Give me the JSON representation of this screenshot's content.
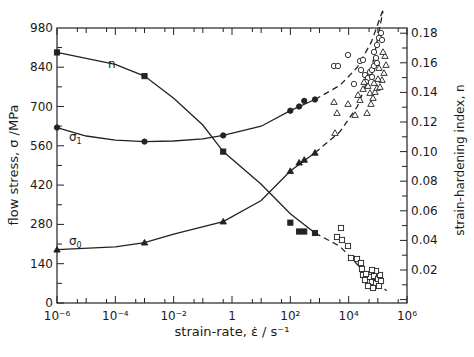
{
  "chart_data": {
    "type": "line",
    "title": "",
    "xlabel": "strain-rate, ε̇ /s⁻¹",
    "ylabel_left": "flow stress, σ /MPa",
    "ylabel_right": "strain-hardening index, n",
    "x_scale": "log",
    "xlim": [
      1e-06,
      1000000.0
    ],
    "ylim_left": [
      0,
      1050
    ],
    "ylim_right": [
      0,
      0.19
    ],
    "x_ticks": [
      "10⁻⁶",
      "10⁻⁴",
      "10⁻²",
      "1",
      "10²",
      "10⁴",
      "10⁶"
    ],
    "y_ticks_left": [
      0,
      140,
      280,
      420,
      560,
      700,
      840,
      980
    ],
    "y_ticks_right": [
      "0.02",
      "0.04",
      "0.06",
      "0.08",
      "0.10",
      "0.12",
      "0.14",
      "0.16",
      "0.18"
    ],
    "grid": false,
    "legend": "curve labels inline",
    "series": [
      {
        "name": "n",
        "axis": "right",
        "marker": "filled square / open square",
        "points": [
          [
            1e-06,
            0.167
          ],
          [
            0.001,
            0.151
          ],
          [
            0.5,
            0.1
          ],
          [
            100,
            0.052
          ],
          [
            200,
            0.046
          ],
          [
            300,
            0.046
          ],
          [
            700,
            0.045
          ]
        ],
        "open_points_approx": [
          [
            5000,
            0.045
          ],
          [
            6000,
            0.043
          ],
          [
            10000,
            0.038
          ],
          [
            20000,
            0.033
          ],
          [
            30000,
            0.028
          ],
          [
            40000,
            0.022
          ],
          [
            60000,
            0.015
          ],
          [
            70000,
            0.013
          ],
          [
            90000,
            0.012
          ]
        ]
      },
      {
        "name": "σ₁",
        "axis": "left",
        "marker": "filled circle / open circle",
        "points": [
          [
            1e-06,
            625
          ],
          [
            0.001,
            575
          ],
          [
            0.5,
            597
          ],
          [
            100,
            685
          ],
          [
            200,
            700
          ],
          [
            300,
            720
          ],
          [
            700,
            725
          ]
        ],
        "open_points_approx": [
          [
            5000,
            800
          ],
          [
            6000,
            810
          ],
          [
            10000,
            820
          ],
          [
            20000,
            850
          ],
          [
            40000,
            900
          ],
          [
            80000,
            960
          ],
          [
            100000,
            1000
          ]
        ]
      },
      {
        "name": "σ₀",
        "axis": "left",
        "marker": "filled triangle / open triangle",
        "points": [
          [
            1e-06,
            190
          ],
          [
            0.001,
            215
          ],
          [
            0.5,
            290
          ],
          [
            100,
            470
          ],
          [
            200,
            500
          ],
          [
            300,
            510
          ],
          [
            700,
            535
          ]
        ],
        "open_points_approx": [
          [
            5000,
            580
          ],
          [
            6000,
            620
          ],
          [
            10000,
            670
          ],
          [
            20000,
            730
          ],
          [
            40000,
            800
          ],
          [
            80000,
            880
          ],
          [
            100000,
            960
          ]
        ]
      }
    ]
  },
  "labels": {
    "xlabel": "strain-rate,  ε̇ / s⁻¹",
    "ylabel_left": "flow stress,  σ /MPa",
    "ylabel_right": "strain-hardening index, n",
    "curve_n": "n",
    "curve_s1": "σ",
    "curve_s1_sub": "1",
    "curve_s0": "σ",
    "curve_s0_sub": "0"
  }
}
